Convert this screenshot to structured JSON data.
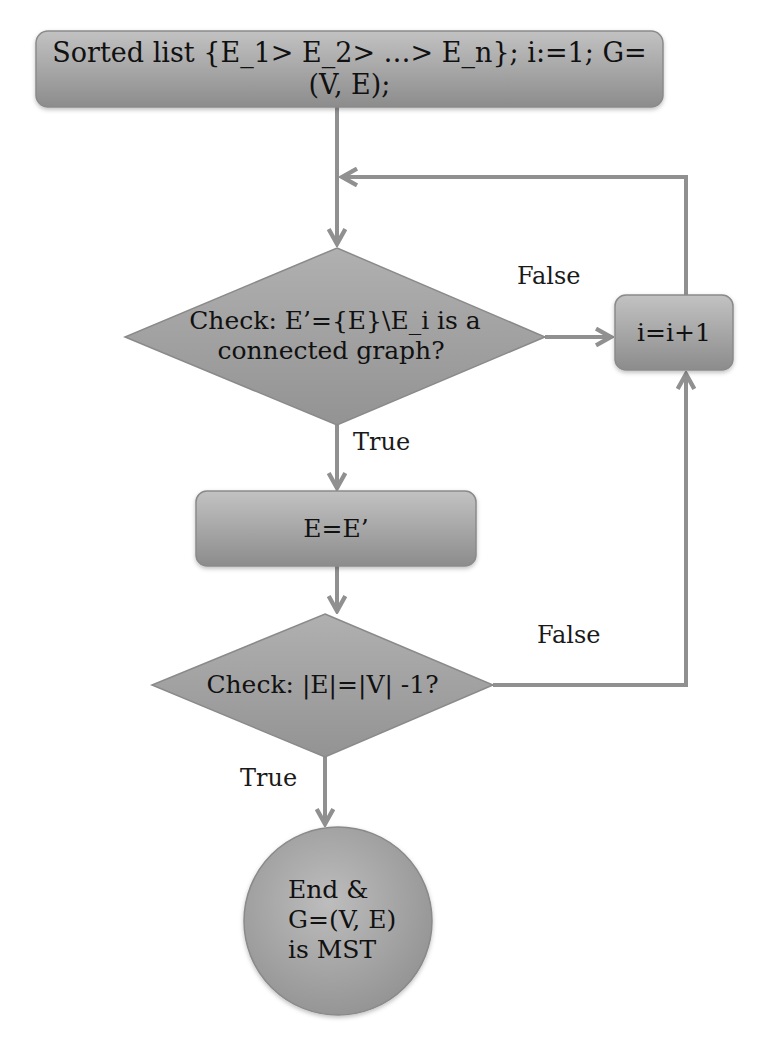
{
  "diagram": {
    "type": "flowchart",
    "colors": {
      "node_fill_light": "#b8b8b8",
      "node_fill_dark": "#8f8f8f",
      "stroke": "#8a8a8a",
      "arrow": "#909090",
      "text": "#111111",
      "background": "#ffffff"
    },
    "nodes": {
      "start": {
        "shape": "rounded-rect",
        "text": "Sorted list {E_1> E_2> …> E_n}; i:=1; G=(V, E);"
      },
      "check_connected": {
        "shape": "diamond",
        "line1": "Check: E’={E}\\E_i is a",
        "line2": "connected graph?"
      },
      "increment": {
        "shape": "rounded-rect",
        "text": "i=i+1"
      },
      "assign": {
        "shape": "rounded-rect",
        "text": "E=E’"
      },
      "check_count": {
        "shape": "diamond",
        "text": "Check: |E|=|V| -1?"
      },
      "end": {
        "shape": "circle",
        "line1": "End &",
        "line2": "G=(V, E)",
        "line3": "is MST"
      }
    },
    "edges": [
      {
        "from": "start",
        "to": "check_connected",
        "label": ""
      },
      {
        "from": "check_connected",
        "to": "increment",
        "label": "False"
      },
      {
        "from": "increment",
        "to": "check_connected",
        "label": ""
      },
      {
        "from": "check_connected",
        "to": "assign",
        "label": "True"
      },
      {
        "from": "assign",
        "to": "check_count",
        "label": ""
      },
      {
        "from": "check_count",
        "to": "increment",
        "label": "False"
      },
      {
        "from": "check_count",
        "to": "end",
        "label": "True"
      }
    ],
    "labels": {
      "false_1": "False",
      "true_1": "True",
      "false_2": "False",
      "true_2": "True"
    }
  }
}
